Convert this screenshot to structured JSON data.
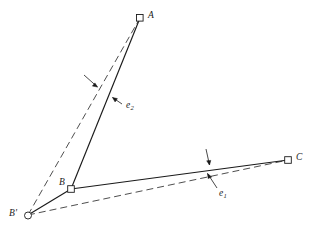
{
  "figure": {
    "type": "line-diagram",
    "background_color": "#ffffff",
    "stroke_color": "#1a1a1a",
    "width": 315,
    "height": 231
  },
  "points": [
    {
      "id": "A",
      "label": "A",
      "marker": "square",
      "x": 140,
      "y": 18,
      "label_x": 148,
      "label_y": 11
    },
    {
      "id": "C",
      "label": "C",
      "marker": "square",
      "x": 288,
      "y": 160,
      "label_x": 296,
      "label_y": 153
    },
    {
      "id": "B",
      "label": "B",
      "marker": "square",
      "x": 71,
      "y": 189,
      "label_x": 59,
      "label_y": 178
    },
    {
      "id": "Bprime",
      "label": "B'",
      "marker": "circle",
      "x": 28,
      "y": 215,
      "label_x": 9,
      "label_y": 209
    }
  ],
  "edges": [
    {
      "id": "BA",
      "from": "B",
      "to": "A",
      "style": "solid"
    },
    {
      "id": "BC",
      "from": "B",
      "to": "C",
      "style": "solid"
    },
    {
      "id": "BpB",
      "from": "Bprime",
      "to": "B",
      "style": "solid"
    },
    {
      "id": "BpA",
      "from": "Bprime",
      "to": "A",
      "style": "dashed"
    },
    {
      "id": "BpC",
      "from": "Bprime",
      "to": "C",
      "style": "dashed"
    }
  ],
  "edge_labels": [
    {
      "id": "e2",
      "base": "e",
      "sub": "2",
      "label_x": 126,
      "label_y": 101,
      "leader_from": {
        "x": 122,
        "y": 104
      },
      "leader_to": {
        "x": 110,
        "y": 96
      },
      "extra_leader_from": {
        "x": 84,
        "y": 75
      },
      "extra_leader_to": {
        "x": 100,
        "y": 89
      }
    },
    {
      "id": "e1",
      "base": "e",
      "sub": "1",
      "label_x": 219,
      "label_y": 189,
      "leader_from": {
        "x": 217,
        "y": 188
      },
      "leader_to": {
        "x": 207,
        "y": 173
      },
      "extra_leader_from": {
        "x": 206,
        "y": 149
      },
      "extra_leader_to": {
        "x": 210,
        "y": 166
      }
    }
  ]
}
